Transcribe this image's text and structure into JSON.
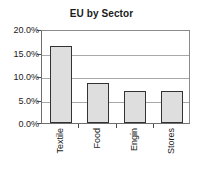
{
  "chart_data": {
    "type": "bar",
    "title": "EU by Sector",
    "xlabel": "",
    "ylabel": "",
    "categories": [
      "Textile",
      "Food",
      "Engin",
      "Stores"
    ],
    "values": [
      16.3,
      8.5,
      6.8,
      6.9
    ],
    "ylim": [
      0,
      20
    ],
    "ytick_values": [
      20,
      15,
      10,
      5,
      0
    ],
    "ytick_labels": [
      "20.0%",
      "15.0%",
      "10.0%",
      "5.0%",
      "0.0%"
    ],
    "value_suffix": "%",
    "grid": true,
    "legend": false,
    "legend_position": "none",
    "bar_fill_color": "#dedede",
    "bar_border_color": "#333333",
    "gridline_color": "#a8a8a8",
    "axis_color": "#4a4a4a",
    "text_color": "#1a1a1a",
    "background_color": "#ffffff",
    "category_label_rotation": -90
  }
}
